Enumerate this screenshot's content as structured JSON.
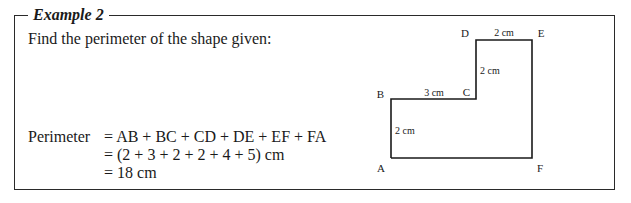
{
  "example": {
    "title": "Example 2",
    "prompt": "Find the perimeter of the shape given:"
  },
  "solution": {
    "line1_lhs": "Perimeter",
    "line1_rhs": "= AB + BC + CD + DE + EF + FA",
    "line2": "= (2 + 3 + 2 + 2 + 4 + 5) cm",
    "line3": "= 18 cm"
  },
  "diagram": {
    "vertices": {
      "A": "A",
      "B": "B",
      "C": "C",
      "D": "D",
      "E": "E",
      "F": "F"
    },
    "edge_labels": {
      "DE": "2 cm",
      "CD": "2 cm",
      "BC": "3 cm",
      "AB": "2 cm"
    }
  }
}
